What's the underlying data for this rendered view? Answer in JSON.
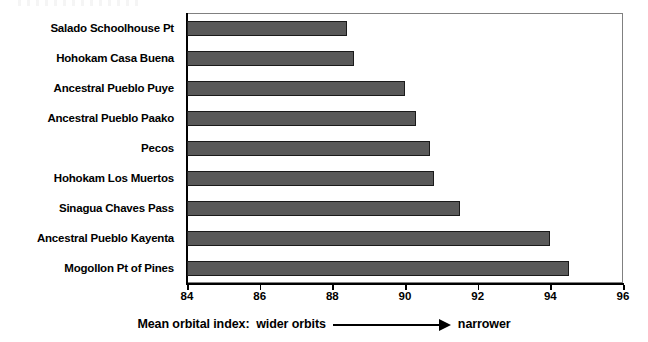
{
  "chart_data": {
    "type": "bar",
    "orientation": "horizontal",
    "title": "",
    "xlabel": "Mean orbital index:  wider orbits  ⟶  narrower",
    "ylabel": "",
    "xlim": [
      84,
      96
    ],
    "xticks": [
      84,
      86,
      88,
      90,
      92,
      94,
      96
    ],
    "xtick_labels": [
      "84",
      "86",
      "88",
      "90",
      "92",
      "94",
      "96"
    ],
    "grid": false,
    "legend": null,
    "categories": [
      "Salado Schoolhouse Pt",
      "Hohokam Casa Buena",
      "Ancestral Pueblo Puye",
      "Ancestral Pueblo Paako",
      "Pecos",
      "Hohokam Los Muertos",
      "Sinagua Chaves Pass",
      "Ancestral Pueblo Kayenta",
      "Mogollon Pt of Pines"
    ],
    "values": [
      88.4,
      88.6,
      90.0,
      90.3,
      90.7,
      90.8,
      91.5,
      94.0,
      94.5
    ],
    "bar_color": "#595959",
    "bar_edge_color": "#1a1a1a",
    "frame_color": "#808080",
    "axis_color": "#000000"
  },
  "caption": {
    "prefix": "Mean orbital index:  wider orbits",
    "suffix": "narrower",
    "arrow_icon": "right-arrow-icon"
  }
}
